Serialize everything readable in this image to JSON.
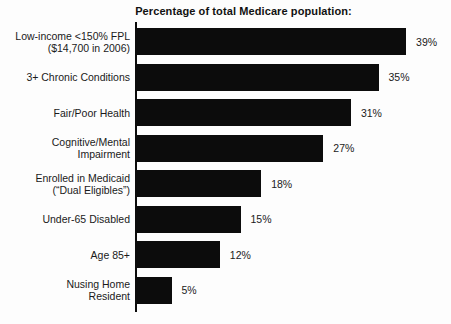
{
  "chart_data": {
    "type": "bar",
    "orientation": "horizontal",
    "title": "Percentage of total Medicare population:",
    "unit": "%",
    "xlim": [
      0,
      43
    ],
    "grid": false,
    "legend": "none",
    "bar_color": "#0c0c0c",
    "background_color": "#fdfdfd",
    "categories": [
      "Low-income <150% FPL ($14,700 in 2006)",
      "3+ Chronic Conditions",
      "Fair/Poor Health",
      "Cognitive/Mental Impairment",
      "Enrolled in Medicaid (“Dual Eligibles”)",
      "Under-65 Disabled",
      "Age 85+",
      "Nusing Home Resident"
    ],
    "values": [
      39,
      35,
      31,
      27,
      18,
      15,
      12,
      5
    ],
    "rows": [
      {
        "label_lines": [
          "Low-income <150% FPL",
          "($14,700 in 2006)"
        ],
        "value": 39,
        "value_label": "39%"
      },
      {
        "label_lines": [
          "3+ Chronic Conditions"
        ],
        "value": 35,
        "value_label": "35%"
      },
      {
        "label_lines": [
          "Fair/Poor Health"
        ],
        "value": 31,
        "value_label": "31%"
      },
      {
        "label_lines": [
          "Cognitive/Mental",
          "Impairment"
        ],
        "value": 27,
        "value_label": "27%"
      },
      {
        "label_lines": [
          "Enrolled in Medicaid",
          "(“Dual Eligibles”)"
        ],
        "value": 18,
        "value_label": "18%"
      },
      {
        "label_lines": [
          "Under-65 Disabled"
        ],
        "value": 15,
        "value_label": "15%"
      },
      {
        "label_lines": [
          "Age 85+"
        ],
        "value": 12,
        "value_label": "12%"
      },
      {
        "label_lines": [
          "Nusing Home",
          "Resident"
        ],
        "value": 5,
        "value_label": "5%"
      }
    ]
  }
}
